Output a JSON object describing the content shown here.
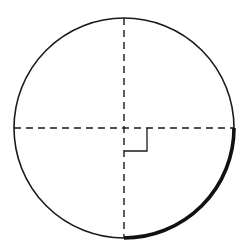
{
  "diagram": {
    "type": "circle-quadrant",
    "colors": {
      "stroke": "#1a1a1a",
      "background": "#ffffff"
    },
    "circle": {
      "cx": 124,
      "cy": 128,
      "r": 110
    },
    "highlighted_arc": {
      "from": "right",
      "to": "bottom",
      "quadrant": "lower-right"
    },
    "right_angle_marker": {
      "size": 23
    }
  }
}
